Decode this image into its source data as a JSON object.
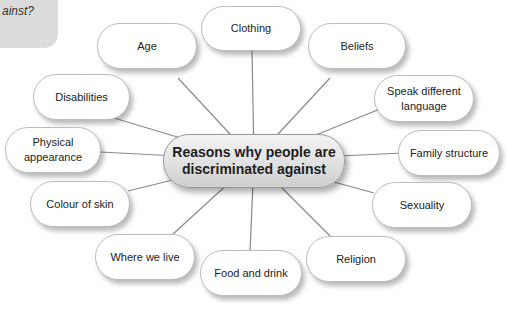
{
  "corner_prompt": {
    "text": "ainst?"
  },
  "center": {
    "line1": "Reasons why people are",
    "line2": "discriminated against"
  },
  "nodes": {
    "clothing": "Clothing",
    "age": "Age",
    "beliefs": "Beliefs",
    "disabilities": "Disabilities",
    "speak_different_language": {
      "line1": "Speak different",
      "line2": "language"
    },
    "physical_appearance": {
      "line1": "Physical",
      "line2": "appearance"
    },
    "family_structure": "Family structure",
    "colour_of_skin": "Colour of skin",
    "sexuality": "Sexuality",
    "where_we_live": "Where we live",
    "food_and_drink": "Food and drink",
    "religion": "Religion"
  },
  "colors": {
    "connector": "#8a8a8a",
    "node_border": "#bdbdbd",
    "center_fill": "#e0e0e0",
    "corner_box": "#dcdcdc"
  }
}
